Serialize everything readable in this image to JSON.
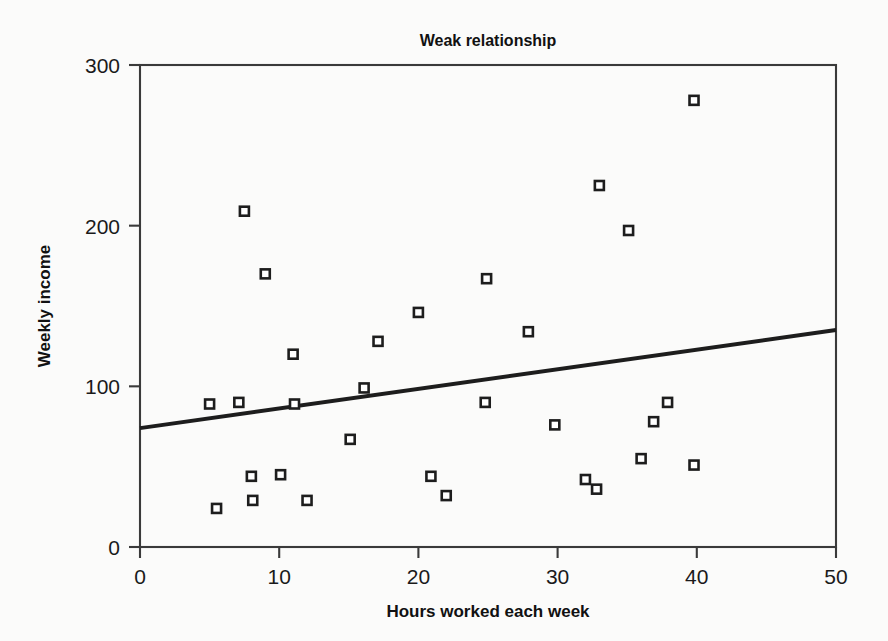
{
  "chart_data": {
    "type": "scatter",
    "title": "Weak relationship",
    "xlabel": "Hours worked each week",
    "ylabel": "Weekly income",
    "xlim": [
      0,
      50
    ],
    "ylim": [
      0,
      300
    ],
    "xticks": [
      0,
      10,
      20,
      30,
      40,
      50
    ],
    "yticks": [
      0,
      100,
      200,
      300
    ],
    "xtick_labels": [
      "0",
      "10",
      "20",
      "30",
      "40",
      "50"
    ],
    "ytick_labels": [
      "0",
      "100",
      "200",
      "300"
    ],
    "grid": false,
    "legend": false,
    "marker_style": "open-square",
    "point_count": 26,
    "points": [
      {
        "x": 5.0,
        "y": 89
      },
      {
        "x": 5.5,
        "y": 24
      },
      {
        "x": 7.1,
        "y": 90
      },
      {
        "x": 7.5,
        "y": 209
      },
      {
        "x": 8.0,
        "y": 44
      },
      {
        "x": 8.1,
        "y": 29
      },
      {
        "x": 9.0,
        "y": 170
      },
      {
        "x": 10.1,
        "y": 45
      },
      {
        "x": 11.0,
        "y": 120
      },
      {
        "x": 11.1,
        "y": 89
      },
      {
        "x": 12.0,
        "y": 29
      },
      {
        "x": 15.1,
        "y": 67
      },
      {
        "x": 16.1,
        "y": 99
      },
      {
        "x": 17.1,
        "y": 128
      },
      {
        "x": 20.0,
        "y": 146
      },
      {
        "x": 20.9,
        "y": 44
      },
      {
        "x": 22.0,
        "y": 32
      },
      {
        "x": 24.8,
        "y": 90
      },
      {
        "x": 24.9,
        "y": 167
      },
      {
        "x": 27.9,
        "y": 134
      },
      {
        "x": 29.8,
        "y": 76
      },
      {
        "x": 32.0,
        "y": 42
      },
      {
        "x": 32.8,
        "y": 36
      },
      {
        "x": 33.0,
        "y": 225
      },
      {
        "x": 35.1,
        "y": 197
      },
      {
        "x": 36.0,
        "y": 55
      },
      {
        "x": 36.9,
        "y": 78
      },
      {
        "x": 37.9,
        "y": 90
      },
      {
        "x": 39.8,
        "y": 51
      },
      {
        "x": 39.8,
        "y": 278
      }
    ],
    "trend_line": {
      "x0": 0,
      "y0": 74,
      "x1": 50,
      "y1": 135,
      "slope": 1.22,
      "intercept": 74
    },
    "colors": {
      "marker_stroke": "#1d1d1d",
      "marker_fill": "#ffffff",
      "trend_line": "#1d1d1d",
      "axis": "#3a3a3a",
      "text": "#111111",
      "background": "#fbfbfa"
    }
  }
}
